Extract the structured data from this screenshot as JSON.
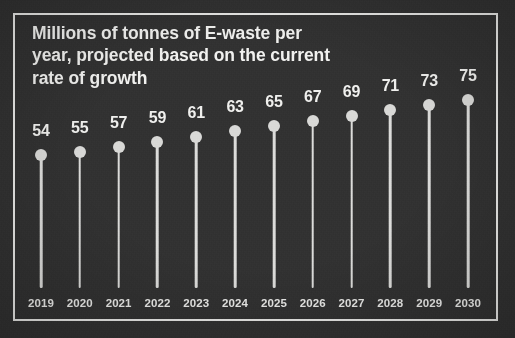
{
  "chart_data": {
    "type": "lollipop",
    "title": "Millions of tonnes of E-waste per\nyear, projected based on the current\nrate of growth",
    "xlabel": "",
    "ylabel": "Millions of tonnes of E-waste per year",
    "categories": [
      "2019",
      "2020",
      "2021",
      "2022",
      "2023",
      "2024",
      "2025",
      "2026",
      "2027",
      "2028",
      "2029",
      "2030"
    ],
    "values": [
      54,
      55,
      57,
      59,
      61,
      63,
      65,
      67,
      69,
      71,
      73,
      75
    ],
    "value_labels": [
      "54",
      "55",
      "57",
      "59",
      "61",
      "63",
      "65",
      "67",
      "69",
      "71",
      "73",
      "75"
    ],
    "ylim": [
      0,
      78
    ],
    "grid": false,
    "legend": null,
    "annotations": []
  },
  "style": {
    "background_color": "#323232",
    "frame_color": "#e9e9e7",
    "marker_color": "#d9d9d7",
    "stem_color": "#dcdcda",
    "title_color": "#f2f2f0",
    "value_label_color": "#f0f0ee",
    "year_label_color": "#ebebe9"
  }
}
